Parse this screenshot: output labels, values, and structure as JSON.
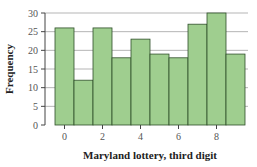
{
  "chart_data": {
    "type": "bar",
    "title": "",
    "xlabel": "Maryland lottery, third digit",
    "ylabel": "Frequency",
    "categories": [
      "0",
      "1",
      "2",
      "3",
      "4",
      "5",
      "6",
      "7",
      "8",
      "9"
    ],
    "values": [
      26,
      12,
      26,
      18,
      23,
      19,
      18,
      27,
      30,
      19
    ],
    "x_ticks": [
      "0",
      "2",
      "4",
      "6",
      "8"
    ],
    "y_ticks": [
      0,
      5,
      10,
      15,
      20,
      25,
      30
    ],
    "ylim": [
      0,
      30
    ],
    "grid": "horizontal",
    "legend": null,
    "bar_color": "#9fce8f",
    "bar_edge_color": "#2f4f2a",
    "grid_color": "#b5b5b5"
  }
}
